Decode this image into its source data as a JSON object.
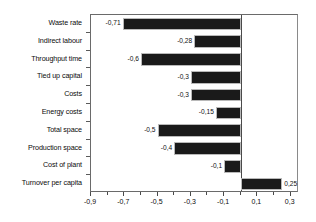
{
  "chart_data": {
    "type": "bar",
    "orientation": "horizontal",
    "title": "",
    "subtitle": "",
    "xlabel": "",
    "ylabel": "",
    "categories": [
      "Waste rate",
      "Indirect labour",
      "Throughput time",
      "Tied up capital",
      "Costs",
      "Energy costs",
      "Total space",
      "Production space",
      "Cost of plant",
      "Turnover per capita"
    ],
    "values": [
      -0.71,
      -0.28,
      -0.6,
      -0.3,
      -0.3,
      -0.15,
      -0.5,
      -0.4,
      -0.1,
      0.25
    ],
    "value_labels": [
      "-0,71",
      "-0,28",
      "-0,6",
      "-0,3",
      "-0,3",
      "-0,15",
      "-0,5",
      "-0,4",
      "-0,1",
      "0,25"
    ],
    "xlim": [
      -0.9,
      0.35
    ],
    "xticks": [
      -0.9,
      -0.7,
      -0.5,
      -0.3,
      -0.1,
      0.1,
      0.3
    ],
    "xtick_labels": [
      "-0,9",
      "-0,7",
      "-0,5",
      "-0,3",
      "-0,1",
      "0,1",
      "0,3"
    ],
    "xticks_minor": [
      -0.8,
      -0.6,
      -0.4,
      -0.2,
      0.0,
      0.2
    ],
    "grid": false,
    "legend": false,
    "decimal_separator": ",",
    "bar_color": "#1a1a1a",
    "bar_outline_color": "#b9b9b9",
    "axis_color": "#4a4a4a",
    "background": "#ffffff"
  }
}
